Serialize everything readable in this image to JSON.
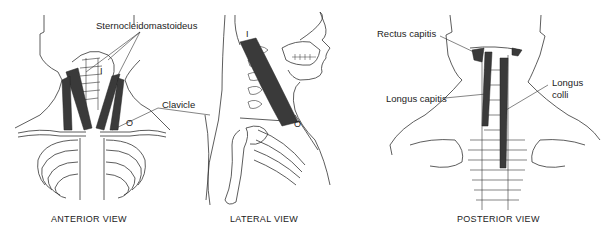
{
  "figure": {
    "views": [
      {
        "id": "anterior",
        "caption": "ANTERIOR VIEW",
        "labels": [
          {
            "text": "Sternocleidomastoideus"
          },
          {
            "text": "Clavicle"
          }
        ],
        "markers": [
          "I",
          "O"
        ]
      },
      {
        "id": "lateral",
        "caption": "LATERAL VIEW",
        "markers": [
          "I",
          "O"
        ]
      },
      {
        "id": "posterior",
        "caption": "POSTERIOR VIEW",
        "labels": [
          {
            "text": "Rectus capitis"
          },
          {
            "text": "Longus capitis"
          },
          {
            "text": "Longus\ncolli"
          }
        ]
      }
    ],
    "labels": {
      "sternocleidomastoideus": "Sternocleidomastoideus",
      "clavicle": "Clavicle",
      "rectus_capitis": "Rectus capitis",
      "longus_capitis": "Longus capitis",
      "longus_colli_line1": "Longus",
      "longus_colli_line2": "colli"
    },
    "captions": {
      "anterior": "ANTERIOR VIEW",
      "lateral": "LATERAL VIEW",
      "posterior": "POSTERIOR VIEW"
    },
    "markers": {
      "insertion": "I",
      "origin": "O"
    },
    "colors": {
      "muscle": "#3a3a3a",
      "line": "#333333",
      "background": "#ffffff"
    }
  }
}
